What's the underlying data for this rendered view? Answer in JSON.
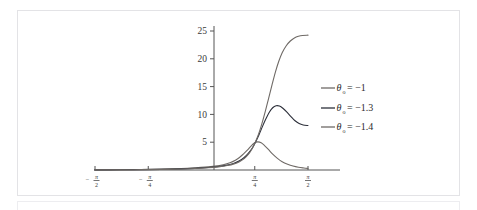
{
  "chart_data": {
    "type": "line",
    "title": "",
    "xlabel": "",
    "ylabel": "",
    "xlim": [
      -1.5707963,
      1.5707963
    ],
    "ylim": [
      0,
      26
    ],
    "grid": false,
    "legend_position": "right",
    "x_ticks": [
      {
        "value": -1.5707963,
        "label_num": "π",
        "label_den": "2",
        "sign": "−"
      },
      {
        "value": -0.7853982,
        "label_num": "π",
        "label_den": "4",
        "sign": "−"
      },
      {
        "value": 0.7853982,
        "label_num": "π",
        "label_den": "4",
        "sign": ""
      },
      {
        "value": 1.5707963,
        "label_num": "π",
        "label_den": "2",
        "sign": ""
      }
    ],
    "y_ticks": [
      {
        "value": 5,
        "label": "5"
      },
      {
        "value": 10,
        "label": "10"
      },
      {
        "value": 15,
        "label": "15"
      },
      {
        "value": 20,
        "label": "20"
      },
      {
        "value": 25,
        "label": "25"
      }
    ],
    "series": [
      {
        "name": "theta0-minus-1",
        "legend_label": "θ₀ = −1",
        "legend_symbol": "θ",
        "legend_subscript": "o",
        "legend_value": "= −1",
        "color": "#6f6a66",
        "points": [
          [
            -1.5707963,
            0.02
          ],
          [
            -1.2,
            0.05
          ],
          [
            -0.9,
            0.09
          ],
          [
            -0.6,
            0.16
          ],
          [
            -0.3,
            0.28
          ],
          [
            -0.1,
            0.4
          ],
          [
            0.05,
            0.52
          ],
          [
            0.2,
            0.7
          ],
          [
            0.32,
            0.95
          ],
          [
            0.42,
            1.3
          ],
          [
            0.5,
            1.75
          ],
          [
            0.56,
            2.25
          ],
          [
            0.62,
            2.9
          ],
          [
            0.68,
            3.6
          ],
          [
            0.73,
            4.3
          ],
          [
            0.78,
            4.85
          ],
          [
            0.83,
            5.05
          ],
          [
            0.88,
            4.9
          ],
          [
            0.93,
            4.4
          ],
          [
            0.99,
            3.65
          ],
          [
            1.05,
            2.85
          ],
          [
            1.12,
            2.1
          ],
          [
            1.19,
            1.5
          ],
          [
            1.27,
            1.05
          ],
          [
            1.35,
            0.72
          ],
          [
            1.43,
            0.5
          ],
          [
            1.51,
            0.36
          ],
          [
            1.5707963,
            0.28
          ]
        ]
      },
      {
        "name": "theta0-minus-1point3",
        "legend_label": "θ₀ = −1.3",
        "legend_symbol": "θ",
        "legend_subscript": "o",
        "legend_value": "= −1.3",
        "color": "#2c2f3a",
        "points": [
          [
            -1.5707963,
            0.02
          ],
          [
            -1.2,
            0.04
          ],
          [
            -0.9,
            0.07
          ],
          [
            -0.6,
            0.12
          ],
          [
            -0.3,
            0.2
          ],
          [
            -0.1,
            0.3
          ],
          [
            0.1,
            0.45
          ],
          [
            0.25,
            0.62
          ],
          [
            0.38,
            0.88
          ],
          [
            0.48,
            1.2
          ],
          [
            0.56,
            1.65
          ],
          [
            0.63,
            2.25
          ],
          [
            0.69,
            3.0
          ],
          [
            0.75,
            3.95
          ],
          [
            0.8,
            5.1
          ],
          [
            0.85,
            6.4
          ],
          [
            0.9,
            7.85
          ],
          [
            0.95,
            9.2
          ],
          [
            1.0,
            10.4
          ],
          [
            1.05,
            11.2
          ],
          [
            1.1,
            11.55
          ],
          [
            1.15,
            11.5
          ],
          [
            1.2,
            11.1
          ],
          [
            1.26,
            10.4
          ],
          [
            1.32,
            9.6
          ],
          [
            1.38,
            8.85
          ],
          [
            1.44,
            8.35
          ],
          [
            1.5,
            8.1
          ],
          [
            1.5707963,
            8.0
          ]
        ]
      },
      {
        "name": "theta0-minus-1point4",
        "legend_label": "θ₀ = −1.4",
        "legend_symbol": "θ",
        "legend_subscript": "o",
        "legend_value": "= −1.4",
        "color": "#6f6a66",
        "points": [
          [
            -1.5707963,
            0.02
          ],
          [
            -1.2,
            0.03
          ],
          [
            -0.9,
            0.06
          ],
          [
            -0.6,
            0.1
          ],
          [
            -0.3,
            0.17
          ],
          [
            -0.1,
            0.26
          ],
          [
            0.1,
            0.4
          ],
          [
            0.25,
            0.56
          ],
          [
            0.38,
            0.8
          ],
          [
            0.48,
            1.1
          ],
          [
            0.56,
            1.5
          ],
          [
            0.63,
            2.05
          ],
          [
            0.69,
            2.8
          ],
          [
            0.74,
            3.7
          ],
          [
            0.79,
            4.9
          ],
          [
            0.84,
            6.4
          ],
          [
            0.89,
            8.3
          ],
          [
            0.94,
            10.5
          ],
          [
            0.99,
            12.9
          ],
          [
            1.04,
            15.3
          ],
          [
            1.09,
            17.6
          ],
          [
            1.14,
            19.55
          ],
          [
            1.19,
            21.1
          ],
          [
            1.25,
            22.35
          ],
          [
            1.31,
            23.2
          ],
          [
            1.37,
            23.75
          ],
          [
            1.43,
            24.05
          ],
          [
            1.49,
            24.2
          ],
          [
            1.5707963,
            24.25
          ]
        ]
      }
    ]
  },
  "axes": {
    "axis_color": "#555555",
    "tick_color": "#555555",
    "label_color": "#3a3a3a"
  },
  "frame": {
    "border_color": "#e3e3e6",
    "background": "#ffffff"
  }
}
